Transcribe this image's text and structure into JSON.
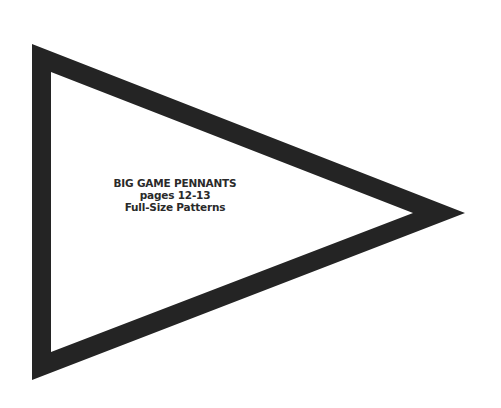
{
  "pattern": {
    "shape": "pennant-triangle",
    "border_color": "#242424",
    "fill_color": "#ffffff"
  },
  "label": {
    "line1": "BIG GAME PENNANTS",
    "line2": "pages 12-13",
    "line3": "Full-Size Patterns"
  }
}
